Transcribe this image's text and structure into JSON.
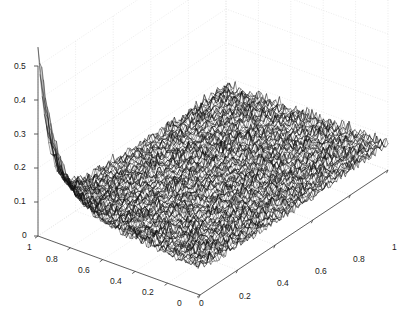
{
  "figure": {
    "background_color": "#ffffff",
    "width": 412,
    "height": 331
  },
  "axes": {
    "grid_color": "#e6e6e6",
    "axis_line_color": "#4d4d4d",
    "tick_text_color": "#1a1a1a",
    "x": {
      "label": "",
      "ticks": [
        "0",
        "0.2",
        "0.4",
        "0.6",
        "0.8",
        "1"
      ],
      "tick_values": [
        0,
        0.2,
        0.4,
        0.6,
        0.8,
        1
      ],
      "range": [
        0,
        1
      ]
    },
    "y": {
      "label": "",
      "ticks": [
        "1",
        "0.8",
        "0.6",
        "0.4",
        "0.2",
        "0"
      ],
      "tick_values": [
        1,
        0.8,
        0.6,
        0.4,
        0.2,
        0
      ],
      "range": [
        0,
        1
      ]
    },
    "z": {
      "label": "",
      "ticks": [
        "0.5",
        "0.4",
        "0.3",
        "0.2",
        "0.1",
        "0"
      ],
      "tick_values": [
        0.5,
        0.4,
        0.3,
        0.2,
        0.1,
        0
      ],
      "range": [
        0,
        0.5
      ]
    }
  },
  "chart_data": {
    "type": "line",
    "subtype": "surface-mesh-3d",
    "title": "",
    "xlabel": "",
    "ylabel": "",
    "zlabel": "",
    "xlim": [
      0,
      1
    ],
    "ylim": [
      0,
      1
    ],
    "zlim": [
      0,
      0.5
    ],
    "grid": true,
    "legend": "none",
    "mesh_color": "#111111",
    "face_color": "#ffffff",
    "surface": {
      "nx": 88,
      "ny": 88,
      "baseline": 0.055,
      "noise_amplitude": 0.035,
      "peak_height": 0.45,
      "peak_x": 0.0,
      "peak_y": 1.0,
      "decay_x": 0.055,
      "decay_y": 0.12,
      "edge_rise_amplitude": 0.045,
      "random_seed": 20240517
    },
    "z_samples": {
      "comment": "Approximate surface height z at selected (x,y) grid points read from the plot.",
      "points": [
        {
          "x": 0.0,
          "y": 1.0,
          "z": 0.49
        },
        {
          "x": 0.0,
          "y": 0.9,
          "z": 0.38
        },
        {
          "x": 0.0,
          "y": 0.8,
          "z": 0.3
        },
        {
          "x": 0.0,
          "y": 0.6,
          "z": 0.21
        },
        {
          "x": 0.0,
          "y": 0.4,
          "z": 0.15
        },
        {
          "x": 0.0,
          "y": 0.2,
          "z": 0.11
        },
        {
          "x": 0.0,
          "y": 0.0,
          "z": 0.09
        },
        {
          "x": 0.2,
          "y": 1.0,
          "z": 0.12
        },
        {
          "x": 0.2,
          "y": 0.5,
          "z": 0.08
        },
        {
          "x": 0.2,
          "y": 0.0,
          "z": 0.08
        },
        {
          "x": 0.5,
          "y": 1.0,
          "z": 0.09
        },
        {
          "x": 0.5,
          "y": 0.5,
          "z": 0.07
        },
        {
          "x": 0.5,
          "y": 0.0,
          "z": 0.08
        },
        {
          "x": 0.8,
          "y": 1.0,
          "z": 0.09
        },
        {
          "x": 0.8,
          "y": 0.5,
          "z": 0.07
        },
        {
          "x": 0.8,
          "y": 0.0,
          "z": 0.08
        },
        {
          "x": 1.0,
          "y": 1.0,
          "z": 0.1
        },
        {
          "x": 1.0,
          "y": 0.5,
          "z": 0.08
        },
        {
          "x": 1.0,
          "y": 0.0,
          "z": 0.09
        }
      ]
    }
  },
  "projection": {
    "origin_px": [
      38,
      236
    ],
    "x_axis_end_px": [
      388,
      170
    ],
    "y_axis_end_px": [
      200,
      295
    ],
    "z_axis_top_px": [
      38,
      66
    ],
    "back_corner_px": [
      232,
      14
    ]
  },
  "tick_labels": {
    "z": [
      {
        "text": "0.5",
        "left": 14,
        "top": 62
      },
      {
        "text": "0.4",
        "left": 14,
        "top": 96
      },
      {
        "text": "0.3",
        "left": 14,
        "top": 130
      },
      {
        "text": "0.2",
        "left": 14,
        "top": 163
      },
      {
        "text": "0.1",
        "left": 14,
        "top": 197
      },
      {
        "text": "0",
        "left": 22,
        "top": 231
      }
    ],
    "y": [
      {
        "text": "1",
        "left": 27,
        "top": 243
      },
      {
        "text": "0.8",
        "left": 46,
        "top": 255
      },
      {
        "text": "0.6",
        "left": 78,
        "top": 266
      },
      {
        "text": "0.4",
        "left": 110,
        "top": 277
      },
      {
        "text": "0.2",
        "left": 142,
        "top": 288
      },
      {
        "text": "0",
        "left": 177,
        "top": 299
      }
    ],
    "x": [
      {
        "text": "0",
        "left": 199,
        "top": 299
      },
      {
        "text": "0.2",
        "left": 239,
        "top": 292
      },
      {
        "text": "0.4",
        "left": 277,
        "top": 279
      },
      {
        "text": "0.6",
        "left": 315,
        "top": 267
      },
      {
        "text": "0.8",
        "left": 353,
        "top": 255
      },
      {
        "text": "1",
        "left": 392,
        "top": 243
      }
    ]
  }
}
